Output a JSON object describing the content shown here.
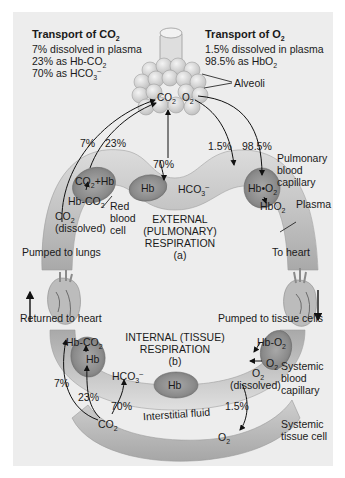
{
  "co2_transport": {
    "title": "Transport of CO",
    "title_sub": "2",
    "line1": "7% dissolved in plasma",
    "line2_pre": "23% as Hb-CO",
    "line2_sub": "2",
    "line3_pre": "70% as HCO",
    "line3_sub": "3",
    "line3_sup": "–"
  },
  "o2_transport": {
    "title": "Transport of O",
    "title_sub": "2",
    "line1": "1.5% dissolved in plasma",
    "line2_pre": "98.5% as HbO",
    "line2_sub": "2"
  },
  "labels": {
    "alveoli": "Alveoli",
    "pulmonary_capillary": [
      "Pulmonary",
      "blood",
      "capillary"
    ],
    "plasma": "Plasma",
    "red_blood_cell": [
      "Red",
      "blood",
      "cell"
    ],
    "external_respiration": [
      "EXTERNAL",
      "(PULMONARY)",
      "RESPIRATION",
      "(a)"
    ],
    "internal_respiration": [
      "INTERNAL (TISSUE)",
      "RESPIRATION",
      "(b)"
    ],
    "pumped_to_lungs": "Pumped to lungs",
    "returned_to_heart": "Returned to heart",
    "to_heart": "To heart",
    "pumped_to_tissue": "Pumped to tissue cells",
    "systemic_capillary": [
      "Systemic",
      "blood",
      "capillary"
    ],
    "systemic_tissue_cell": [
      "Systemic",
      "tissue cell"
    ],
    "interstitial_fluid": "Interstitial fluid"
  },
  "pulmonary": {
    "co2": "CO",
    "co2_sub": "2",
    "o2": "O",
    "o2_sub": "2",
    "pct_7": "7%",
    "pct_23": "23%",
    "pct_70": "70%",
    "pct_1_5": "1.5%",
    "pct_98_5": "98.5%",
    "co2_hb": "CO",
    "co2_hb_sub": "2",
    "co2_hb_post": "+Hb",
    "hb_co2": "Hb-CO",
    "hb_co2_sub": "2",
    "co2_dissolved": "CO",
    "co2_dissolved_sub": "2",
    "dissolved": "(dissolved)",
    "hb": "Hb",
    "hco3": "HCO",
    "hco3_sub": "3",
    "hco3_sup": "–",
    "hb_o2": "Hb•O",
    "hb_o2_sub": "2",
    "hbo2": "HbO",
    "hbo2_sub": "2"
  },
  "systemic": {
    "hb_co2": "Hb-CO",
    "hb_co2_sub": "2",
    "hb": "Hb",
    "hco3": "HCO",
    "hco3_sub": "3",
    "hco3_sup": "–",
    "hb_center": "Hb",
    "hb_o2": "Hb-O",
    "hb_o2_sub": "2",
    "o2": "O",
    "o2_sub": "2",
    "o2_dissolved": "O",
    "o2_dissolved_sub": "2",
    "dissolved": "(dissolved)",
    "pct_7": "7%",
    "pct_23": "23%",
    "pct_70": "70%",
    "pct_1_5": "1.5%",
    "co2": "CO",
    "co2_sub": "2",
    "o2_tissue": "O",
    "o2_tissue_sub": "2"
  },
  "colors": {
    "panel": "#ededed",
    "vessel": "#c8c8c8",
    "rbc": "#8f8f8f",
    "tissue": "#bdbdbd",
    "alveoli": "#dcdcdc"
  }
}
